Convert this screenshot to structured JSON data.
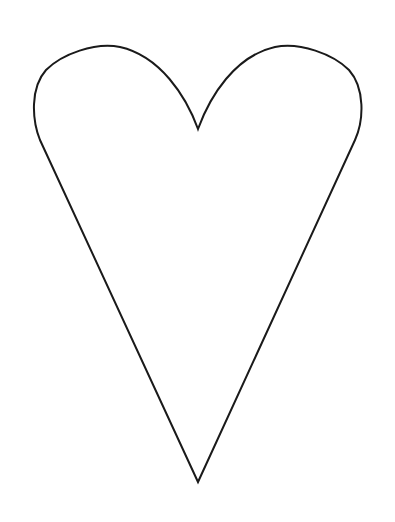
{
  "image": {
    "description": "Heart outline",
    "background": "#ffffff",
    "stroke_color": "#1a1a1a",
    "stroke_width": 2,
    "shape": {
      "name": "heart",
      "left_lobe_top": [
        107,
        46
      ],
      "right_lobe_top": [
        288,
        46
      ],
      "center_notch": [
        198,
        129
      ],
      "left_extreme": [
        36,
        103
      ],
      "right_extreme": [
        359,
        103
      ],
      "bottom_point": [
        198,
        482
      ]
    }
  }
}
